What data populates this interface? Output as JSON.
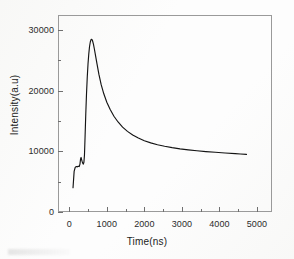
{
  "figure": {
    "background_color": "#ffffff",
    "frame_color": "#9a9a9a",
    "curve_color": "#141414"
  },
  "chart_data": {
    "type": "line",
    "title": "",
    "xlabel": "Time(ns)",
    "ylabel": "Intensity(a.u)",
    "xlim": [
      -300,
      5400
    ],
    "ylim": [
      0,
      32500
    ],
    "grid": false,
    "legend": null,
    "x_ticks": [
      0,
      1000,
      2000,
      3000,
      4000,
      5000
    ],
    "x_tick_labels": [
      "0",
      "1000",
      "2000",
      "3000",
      "4000",
      "5000"
    ],
    "x_minor_tick_interval": 500,
    "y_ticks": [
      0,
      10000,
      20000,
      30000
    ],
    "y_tick_labels": [
      "0",
      "10000",
      "20000",
      "30000"
    ],
    "y_minor_tick_interval": 5000,
    "series": [
      {
        "name": "luminescence decay",
        "color": "#141414",
        "peak_x": 600,
        "peak_y": 28500,
        "baseline_start_y": 4000,
        "tail_end_x": 4720,
        "tail_end_y": 9500,
        "x": [
          100,
          130,
          160,
          190,
          215,
          240,
          265,
          285,
          300,
          315,
          330,
          345,
          360,
          375,
          390,
          405,
          420,
          440,
          460,
          480,
          500,
          520,
          540,
          560,
          580,
          600,
          620,
          645,
          670,
          700,
          740,
          790,
          850,
          920,
          1000,
          1090,
          1190,
          1300,
          1420,
          1550,
          1690,
          1840,
          2000,
          2170,
          2350,
          2540,
          2740,
          2950,
          3170,
          3400,
          3640,
          3890,
          4150,
          4420,
          4560,
          4720
        ],
        "y": [
          4000,
          6700,
          7400,
          7500,
          7450,
          7550,
          7500,
          7900,
          8700,
          9000,
          8600,
          8300,
          8050,
          7900,
          8200,
          9400,
          12200,
          16200,
          19600,
          22300,
          24500,
          26100,
          27300,
          28050,
          28450,
          28500,
          28250,
          27650,
          26850,
          25800,
          24400,
          22700,
          21000,
          19500,
          18100,
          16900,
          15800,
          14850,
          14000,
          13300,
          12700,
          12200,
          11750,
          11400,
          11100,
          10850,
          10620,
          10420,
          10250,
          10100,
          9970,
          9850,
          9740,
          9630,
          9570,
          9500
        ]
      }
    ]
  }
}
